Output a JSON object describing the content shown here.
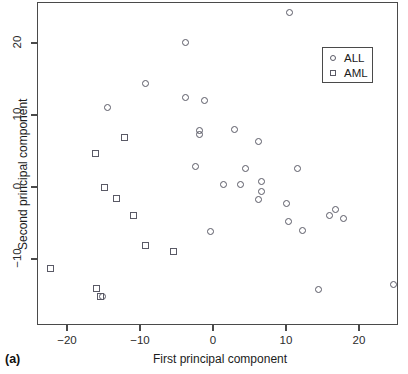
{
  "caption": "(a)",
  "axes": {
    "xlabel": "First principal component",
    "ylabel": "Second principal component",
    "xticks": [
      "-20",
      "-10",
      "0",
      "10",
      "20"
    ],
    "yticks": [
      "20",
      "10",
      "0",
      "-10"
    ]
  },
  "legend": {
    "entries": [
      {
        "label": "ALL",
        "marker": "circle-marker"
      },
      {
        "label": "AML",
        "marker": "square-marker"
      }
    ]
  },
  "chart_data": {
    "type": "scatter",
    "title": "",
    "xlabel": "First principal component",
    "ylabel": "Second principal component",
    "xlim": [
      -24.5,
      25.5
    ],
    "ylim": [
      -15.5,
      25.5
    ],
    "xticks": [
      -20,
      -10,
      0,
      10,
      20
    ],
    "yticks": [
      -10,
      0,
      10,
      20
    ],
    "grid": false,
    "legend_position": "top-right",
    "series": [
      {
        "name": "ALL",
        "marker": "circle",
        "points": [
          [
            10.5,
            24.3
          ],
          [
            -3.7,
            20.1
          ],
          [
            -9.3,
            14.4
          ],
          [
            -14.5,
            11.1
          ],
          [
            -3.8,
            12.4
          ],
          [
            -1.1,
            12.0
          ],
          [
            -1.9,
            7.9
          ],
          [
            -1.8,
            7.3
          ],
          [
            2.9,
            8.0
          ],
          [
            6.2,
            6.3
          ],
          [
            -2.4,
            2.9
          ],
          [
            4.5,
            2.6
          ],
          [
            11.6,
            2.6
          ],
          [
            1.4,
            0.3
          ],
          [
            3.8,
            0.4
          ],
          [
            6.7,
            0.8
          ],
          [
            6.7,
            -0.6
          ],
          [
            6.2,
            -1.8
          ],
          [
            10.0,
            -2.3
          ],
          [
            16.8,
            -3.1
          ],
          [
            15.9,
            -4.0
          ],
          [
            17.9,
            -4.4
          ],
          [
            10.3,
            -4.8
          ],
          [
            12.2,
            -6.1
          ],
          [
            -0.3,
            -6.2
          ],
          [
            14.5,
            -14.3
          ],
          [
            24.7,
            -13.6
          ],
          [
            -15.2,
            -15.2
          ]
        ]
      },
      {
        "name": "AML",
        "marker": "square",
        "points": [
          [
            -12.1,
            6.9
          ],
          [
            -16.1,
            4.6
          ],
          [
            -14.8,
            -0.1
          ],
          [
            -13.2,
            -1.6
          ],
          [
            -10.9,
            -3.9
          ],
          [
            -9.3,
            -8.1
          ],
          [
            -5.4,
            -9.0
          ],
          [
            -22.3,
            -11.3
          ],
          [
            -16.0,
            -14.1
          ],
          [
            -15.4,
            -15.2
          ]
        ]
      }
    ]
  }
}
